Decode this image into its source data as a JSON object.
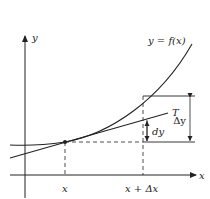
{
  "diagram": {
    "type": "differential-approximation",
    "colors": {
      "ink": "#222222",
      "background": "#ffffff"
    },
    "labels": {
      "y_axis": "y",
      "x_axis": "x",
      "curve": "y = f(x)",
      "tangent": "T",
      "delta_y": "Δy",
      "dy": "dy",
      "x_tick": "x",
      "x_plus_dx_tick": "x + Δx"
    }
  }
}
